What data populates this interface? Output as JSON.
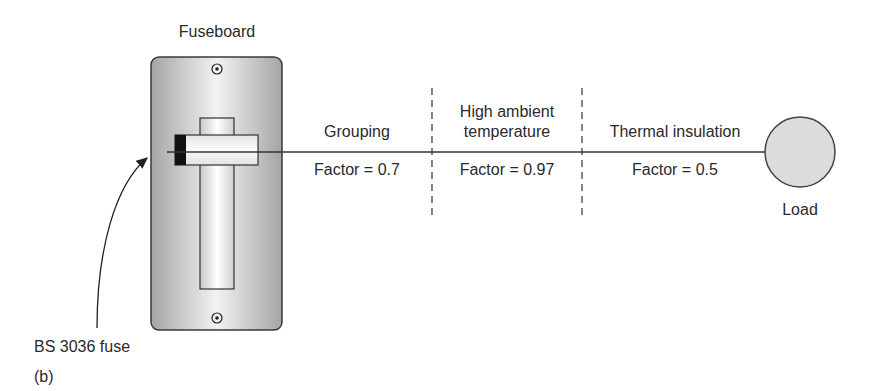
{
  "diagram": {
    "fuseboard_label": "Fuseboard",
    "fuse_label": "BS 3036 fuse",
    "panel_label": "(b)",
    "load_label": "Load",
    "sections": [
      {
        "title_line1": "Grouping",
        "title_line2": "",
        "factor": "Factor = 0.7"
      },
      {
        "title_line1": "High ambient",
        "title_line2": "temperature",
        "factor": "Factor = 0.97"
      },
      {
        "title_line1": "Thermal insulation",
        "title_line2": "",
        "factor": "Factor = 0.5"
      }
    ],
    "colors": {
      "board_edge": "#3a3a3a",
      "board_fill_light": "#f4f4f4",
      "board_fill_dark": "#a9a9a9",
      "load_fill": "#dcdcdc",
      "line": "#333333"
    }
  }
}
